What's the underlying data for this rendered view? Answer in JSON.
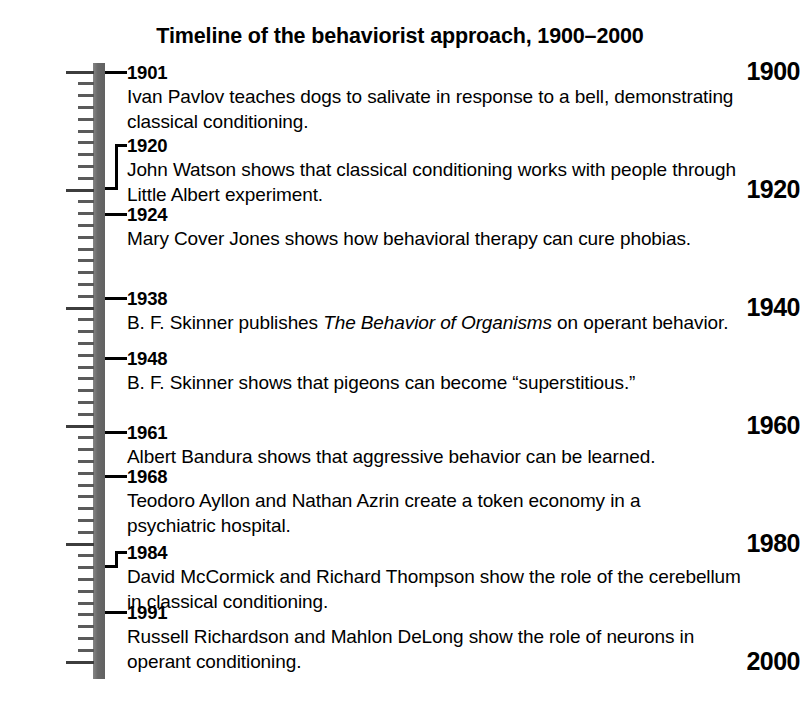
{
  "title": "Timeline of the behaviorist approach, 1900–2000",
  "axis": {
    "start_year": 1900,
    "end_year": 2000,
    "major_tick_interval": 20,
    "minor_tick_interval": 2,
    "bar_color": "#6e6e6e",
    "tick_color": "#5a5a5a",
    "labels": [
      {
        "year": 1900,
        "text": "1900"
      },
      {
        "year": 1920,
        "text": "1920"
      },
      {
        "year": 1940,
        "text": "1940"
      },
      {
        "year": 1960,
        "text": "1960"
      },
      {
        "year": 1980,
        "text": "1980"
      },
      {
        "year": 2000,
        "text": "2000"
      }
    ]
  },
  "events": [
    {
      "year": 1901,
      "year_label": "1901",
      "connector": "straight",
      "text": "Ivan Pavlov teaches dogs to salivate in response to a bell, demonstrating classical conditioning.",
      "lines": [
        "Ivan Pavlov teaches dogs to salivate in response to a bell, demonstrating",
        "classical conditioning."
      ],
      "italic": ""
    },
    {
      "year": 1920,
      "year_label": "1920",
      "connector": "bracket",
      "text": "John Watson shows that classical conditioning works with people through Little Albert experiment.",
      "lines": [
        "John Watson shows that classical conditioning works with people through",
        "Little Albert experiment."
      ],
      "italic": ""
    },
    {
      "year": 1924,
      "year_label": "1924",
      "connector": "straight",
      "text": "Mary Cover Jones shows how behavioral therapy can cure phobias.",
      "lines": [
        "Mary Cover Jones shows how behavioral therapy can cure phobias."
      ],
      "italic": ""
    },
    {
      "year": 1938,
      "year_label": "1938",
      "connector": "straight",
      "text": "B. F. Skinner publishes The Behavior of Organisms on operant behavior.",
      "lines": [
        "B. F. Skinner publishes The Behavior of Organisms on operant behavior."
      ],
      "italic": "The Behavior of Organisms"
    },
    {
      "year": 1948,
      "year_label": "1948",
      "connector": "straight",
      "text": "B. F. Skinner shows that pigeons can become “superstitious.”",
      "lines": [
        "B. F. Skinner shows that pigeons can become “superstitious.”"
      ],
      "italic": ""
    },
    {
      "year": 1961,
      "year_label": "1961",
      "connector": "straight",
      "text": "Albert Bandura shows that aggressive behavior can be learned.",
      "lines": [
        "Albert Bandura shows that aggressive behavior can be learned."
      ],
      "italic": ""
    },
    {
      "year": 1968,
      "year_label": "1968",
      "connector": "straight",
      "text": "Teodoro Ayllon and Nathan Azrin create a token economy in a psychiatric hospital.",
      "lines": [
        "Teodoro Ayllon and Nathan Azrin create a token economy in a",
        "psychiatric hospital."
      ],
      "italic": ""
    },
    {
      "year": 1984,
      "year_label": "1984",
      "connector": "bracket",
      "text": "David McCormick and Richard Thompson show the role of the cerebellum in classical conditioning.",
      "lines": [
        "David McCormick and Richard Thompson show the role of the cerebellum",
        "in classical conditioning."
      ],
      "italic": ""
    },
    {
      "year": 1991,
      "year_label": "1991",
      "connector": "straight",
      "text": "Russell Richardson and Mahlon DeLong show the role of neurons in operant conditioning.",
      "lines": [
        "Russell Richardson and Mahlon DeLong show the role of neurons in",
        "operant conditioning."
      ],
      "italic": ""
    }
  ],
  "chart_data": {
    "type": "timeline",
    "title": "Timeline of the behaviorist approach, 1900–2000",
    "axis_orientation": "vertical",
    "axis_range": [
      1900,
      2000
    ],
    "major_ticks": [
      1900,
      1920,
      1940,
      1960,
      1980,
      2000
    ],
    "minor_tick_step": 2,
    "x": [
      1901,
      1920,
      1924,
      1938,
      1948,
      1961,
      1968,
      1984,
      1991
    ],
    "labels": [
      "Ivan Pavlov teaches dogs to salivate in response to a bell, demonstrating classical conditioning.",
      "John Watson shows that classical conditioning works with people through Little Albert experiment.",
      "Mary Cover Jones shows how behavioral therapy can cure phobias.",
      "B. F. Skinner publishes The Behavior of Organisms on operant behavior.",
      "B. F. Skinner shows that pigeons can become “superstitious.”",
      "Albert Bandura shows that aggressive behavior can be learned.",
      "Teodoro Ayllon and Nathan Azrin create a token economy in a psychiatric hospital.",
      "David McCormick and Richard Thompson show the role of the cerebellum in classical conditioning.",
      "Russell Richardson and Mahlon DeLong show the role of neurons in operant conditioning."
    ],
    "xlabel": "",
    "ylabel": "",
    "grid": false,
    "legend": "none"
  }
}
